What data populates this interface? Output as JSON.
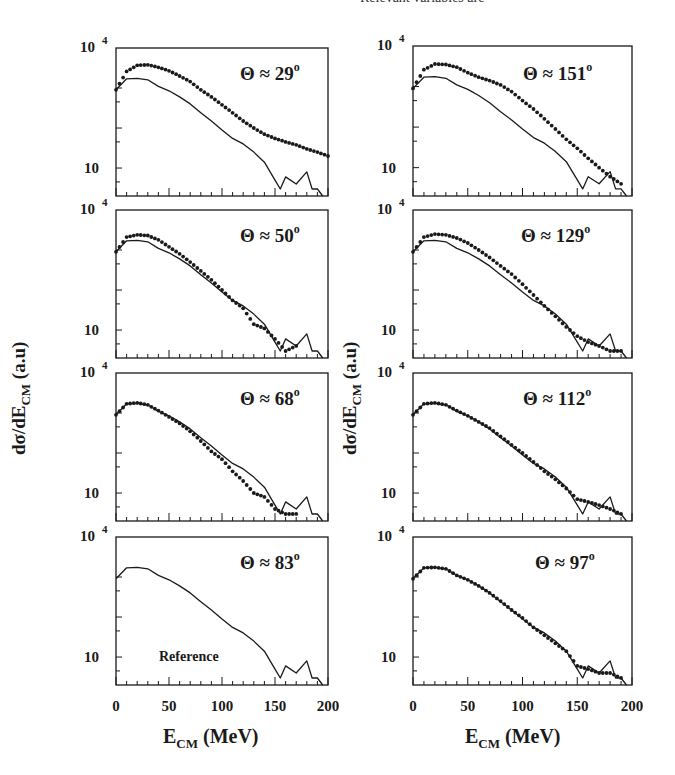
{
  "header": {
    "partial_text": "Relevant variables are"
  },
  "figure": {
    "ylabel_main": "dσ/dE",
    "ylabel_sub": "CM",
    "ylabel_unit": " (a.u)",
    "xlabel_main": "E",
    "xlabel_sub": "CM",
    "xlabel_unit": " (MeV)",
    "ytick_top": "10",
    "ytick_top_exp": "4",
    "ytick_bottom": "10",
    "xticks": [
      "0",
      "50",
      "100",
      "150",
      "200"
    ],
    "reference_label": "Reference"
  },
  "chart_data": [
    {
      "panel": "Θ ≈ 29°",
      "column": "left",
      "row": 1,
      "type": "line+scatter",
      "xlabel": "E_CM (MeV)",
      "ylabel": "dσ/dE_CM (a.u)",
      "yscale": "log",
      "xlim": [
        0,
        200
      ],
      "ylim": [
        2,
        10000
      ],
      "series": [
        {
          "name": "data (points)",
          "x": [
            0,
            10,
            20,
            30,
            40,
            50,
            60,
            70,
            80,
            90,
            100,
            110,
            120,
            130,
            140,
            150,
            160,
            170,
            180,
            190,
            200
          ],
          "y": [
            900,
            2600,
            3700,
            3800,
            3300,
            2700,
            2000,
            1450,
            900,
            600,
            380,
            240,
            150,
            100,
            70,
            55,
            45,
            38,
            30,
            25,
            20
          ]
        },
        {
          "name": "reference (line)",
          "x": [
            0,
            10,
            20,
            30,
            40,
            50,
            60,
            70,
            80,
            90,
            100,
            110,
            120,
            130,
            140,
            150,
            155,
            160,
            170,
            180,
            185,
            190,
            195
          ],
          "y": [
            900,
            1700,
            1750,
            1600,
            1100,
            850,
            600,
            400,
            240,
            150,
            90,
            55,
            40,
            25,
            14,
            5,
            3,
            6,
            4,
            8,
            3,
            3,
            2
          ]
        }
      ]
    },
    {
      "panel": "Θ ≈ 50°",
      "column": "left",
      "row": 2,
      "type": "line+scatter",
      "yscale": "log",
      "xlim": [
        0,
        200
      ],
      "ylim": [
        2,
        10000
      ],
      "series": [
        {
          "name": "data (points)",
          "x": [
            0,
            10,
            20,
            30,
            40,
            50,
            60,
            70,
            80,
            90,
            100,
            110,
            120,
            130,
            140,
            150,
            160,
            170
          ],
          "y": [
            900,
            2100,
            2400,
            2300,
            1800,
            1200,
            800,
            500,
            300,
            180,
            100,
            55,
            35,
            14,
            11,
            6,
            3,
            4
          ]
        },
        {
          "name": "reference (line)",
          "x": [
            0,
            10,
            20,
            30,
            40,
            50,
            60,
            70,
            80,
            90,
            100,
            110,
            120,
            130,
            140,
            150,
            155,
            160,
            170,
            180,
            185,
            190,
            195
          ],
          "y": [
            900,
            1700,
            1750,
            1600,
            1100,
            850,
            600,
            400,
            240,
            150,
            90,
            55,
            40,
            25,
            14,
            5,
            3,
            6,
            4,
            8,
            3,
            3,
            2
          ]
        }
      ]
    },
    {
      "panel": "Θ ≈ 68°",
      "column": "left",
      "row": 3,
      "type": "line+scatter",
      "yscale": "log",
      "xlim": [
        0,
        200
      ],
      "ylim": [
        2,
        10000
      ],
      "series": [
        {
          "name": "data (points)",
          "x": [
            0,
            10,
            20,
            30,
            40,
            50,
            60,
            70,
            80,
            90,
            100,
            110,
            120,
            130,
            140,
            150,
            160,
            170
          ],
          "y": [
            900,
            1700,
            1800,
            1600,
            1150,
            800,
            550,
            350,
            200,
            110,
            70,
            35,
            20,
            10,
            8,
            4,
            3,
            3
          ]
        },
        {
          "name": "reference (line)",
          "x": [
            0,
            10,
            20,
            30,
            40,
            50,
            60,
            70,
            80,
            90,
            100,
            110,
            120,
            130,
            140,
            150,
            155,
            160,
            170,
            180,
            185,
            190,
            195
          ],
          "y": [
            900,
            1700,
            1750,
            1600,
            1100,
            850,
            600,
            400,
            240,
            150,
            90,
            55,
            40,
            25,
            14,
            5,
            3,
            6,
            4,
            8,
            3,
            3,
            2
          ]
        }
      ]
    },
    {
      "panel": "Θ ≈ 83°",
      "column": "left",
      "row": 4,
      "type": "line",
      "annotation": "Reference",
      "yscale": "log",
      "xlim": [
        0,
        200
      ],
      "ylim": [
        2,
        10000
      ],
      "series": [
        {
          "name": "reference (line)",
          "x": [
            0,
            10,
            20,
            30,
            40,
            50,
            60,
            70,
            80,
            90,
            100,
            110,
            120,
            130,
            140,
            150,
            155,
            160,
            170,
            180,
            185,
            190,
            195
          ],
          "y": [
            900,
            1700,
            1750,
            1600,
            1100,
            850,
            600,
            400,
            240,
            150,
            90,
            55,
            40,
            25,
            14,
            5,
            3,
            6,
            4,
            8,
            3,
            3,
            2
          ]
        }
      ]
    },
    {
      "panel": "Θ ≈ 151°",
      "column": "right",
      "row": 1,
      "type": "line+scatter",
      "yscale": "log",
      "xlim": [
        0,
        200
      ],
      "ylim": [
        2,
        10000
      ],
      "series": [
        {
          "name": "data (points)",
          "x": [
            0,
            10,
            20,
            30,
            40,
            50,
            60,
            70,
            80,
            90,
            100,
            110,
            120,
            130,
            140,
            150,
            160,
            170,
            180,
            190
          ],
          "y": [
            900,
            2600,
            3600,
            3500,
            3000,
            2200,
            1700,
            1400,
            1100,
            750,
            450,
            280,
            160,
            90,
            50,
            30,
            17,
            10,
            6,
            4
          ]
        },
        {
          "name": "reference (line)",
          "x": [
            0,
            10,
            20,
            30,
            40,
            50,
            60,
            70,
            80,
            90,
            100,
            110,
            120,
            130,
            140,
            150,
            155,
            160,
            170,
            180,
            185,
            190,
            195
          ],
          "y": [
            900,
            1700,
            1750,
            1600,
            1100,
            850,
            600,
            400,
            240,
            150,
            90,
            55,
            40,
            25,
            14,
            5,
            3,
            6,
            4,
            8,
            3,
            3,
            2
          ]
        }
      ]
    },
    {
      "panel": "Θ ≈ 129°",
      "column": "right",
      "row": 2,
      "type": "line+scatter",
      "yscale": "log",
      "xlim": [
        0,
        200
      ],
      "ylim": [
        2,
        10000
      ],
      "series": [
        {
          "name": "data (points)",
          "x": [
            0,
            10,
            20,
            30,
            40,
            50,
            60,
            70,
            80,
            90,
            100,
            110,
            120,
            130,
            140,
            150,
            160,
            170,
            180,
            190
          ],
          "y": [
            900,
            2100,
            2500,
            2400,
            2000,
            1500,
            1000,
            650,
            400,
            250,
            140,
            75,
            40,
            22,
            12,
            7,
            5,
            4,
            3,
            3
          ]
        },
        {
          "name": "reference (line)",
          "x": [
            0,
            10,
            20,
            30,
            40,
            50,
            60,
            70,
            80,
            90,
            100,
            110,
            120,
            130,
            140,
            150,
            155,
            160,
            170,
            180,
            185,
            190,
            195
          ],
          "y": [
            900,
            1700,
            1750,
            1600,
            1100,
            850,
            600,
            400,
            240,
            150,
            90,
            55,
            40,
            25,
            14,
            5,
            3,
            6,
            4,
            8,
            3,
            3,
            2
          ]
        }
      ]
    },
    {
      "panel": "Θ ≈ 112°",
      "column": "right",
      "row": 3,
      "type": "line+scatter",
      "yscale": "log",
      "xlim": [
        0,
        200
      ],
      "ylim": [
        2,
        10000
      ],
      "series": [
        {
          "name": "data (points)",
          "x": [
            0,
            10,
            20,
            30,
            40,
            50,
            60,
            70,
            80,
            90,
            100,
            110,
            120,
            130,
            140,
            150,
            160,
            170,
            180,
            190
          ],
          "y": [
            900,
            1700,
            1800,
            1600,
            1150,
            850,
            600,
            420,
            260,
            160,
            100,
            60,
            35,
            22,
            13,
            7,
            6,
            5,
            4,
            3
          ]
        },
        {
          "name": "reference (line)",
          "x": [
            0,
            10,
            20,
            30,
            40,
            50,
            60,
            70,
            80,
            90,
            100,
            110,
            120,
            130,
            140,
            150,
            155,
            160,
            170,
            180,
            185,
            190,
            195
          ],
          "y": [
            900,
            1700,
            1750,
            1600,
            1100,
            850,
            600,
            400,
            240,
            150,
            90,
            55,
            40,
            25,
            14,
            5,
            3,
            6,
            4,
            8,
            3,
            3,
            2
          ]
        }
      ]
    },
    {
      "panel": "Θ ≈ 97°",
      "column": "right",
      "row": 4,
      "type": "line+scatter",
      "yscale": "log",
      "xlim": [
        0,
        200
      ],
      "ylim": [
        2,
        10000
      ],
      "series": [
        {
          "name": "data (points)",
          "x": [
            0,
            10,
            20,
            30,
            40,
            50,
            60,
            70,
            80,
            90,
            100,
            110,
            120,
            130,
            140,
            150,
            160,
            170,
            180,
            190
          ],
          "y": [
            900,
            1700,
            1750,
            1600,
            1100,
            850,
            600,
            400,
            250,
            150,
            95,
            55,
            35,
            22,
            14,
            6,
            5,
            4,
            4,
            3
          ]
        },
        {
          "name": "reference (line)",
          "x": [
            0,
            10,
            20,
            30,
            40,
            50,
            60,
            70,
            80,
            90,
            100,
            110,
            120,
            130,
            140,
            150,
            155,
            160,
            170,
            180,
            185,
            190,
            195
          ],
          "y": [
            900,
            1700,
            1750,
            1600,
            1100,
            850,
            600,
            400,
            240,
            150,
            90,
            55,
            40,
            25,
            14,
            5,
            3,
            6,
            4,
            8,
            3,
            3,
            2
          ]
        }
      ]
    }
  ],
  "layout": {
    "frames": [
      {
        "x": 116,
        "y": 48,
        "w": 212,
        "h": 148
      },
      {
        "x": 116,
        "y": 210,
        "w": 212,
        "h": 148
      },
      {
        "x": 116,
        "y": 373,
        "w": 212,
        "h": 148
      },
      {
        "x": 116,
        "y": 537,
        "w": 212,
        "h": 148
      },
      {
        "x": 413,
        "y": 46,
        "w": 219,
        "h": 150
      },
      {
        "x": 413,
        "y": 210,
        "w": 219,
        "h": 148
      },
      {
        "x": 413,
        "y": 373,
        "w": 219,
        "h": 148
      },
      {
        "x": 413,
        "y": 537,
        "w": 219,
        "h": 148
      }
    ],
    "angle_label_pos": [
      {
        "x": 240,
        "y": 80
      },
      {
        "x": 240,
        "y": 242
      },
      {
        "x": 240,
        "y": 405
      },
      {
        "x": 240,
        "y": 569
      },
      {
        "x": 523,
        "y": 80
      },
      {
        "x": 521,
        "y": 242
      },
      {
        "x": 523,
        "y": 405
      },
      {
        "x": 535,
        "y": 569
      }
    ],
    "angle_labels": [
      "Θ ≈ 29",
      "Θ ≈ 50",
      "Θ ≈ 68",
      "Θ ≈ 83",
      "Θ ≈ 151",
      "Θ ≈ 129",
      "Θ ≈ 112",
      "Θ ≈ 97"
    ]
  }
}
